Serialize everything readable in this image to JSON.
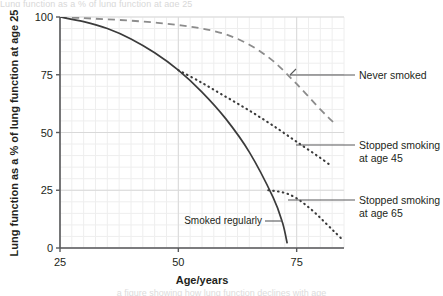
{
  "figure": {
    "background_color": "#ffffff",
    "plot": {
      "left_px": 60,
      "right_px": 344,
      "top_px": 17,
      "bottom_px": 248
    }
  },
  "axes": {
    "x": {
      "title": "Age/years",
      "ticks": [
        "25",
        "50",
        "75"
      ],
      "tick_values": [
        25,
        50,
        75
      ],
      "min": 25,
      "max": 85,
      "minor_step": 2.5
    },
    "y": {
      "title": "Lung function as a % of lung function at age 25",
      "ticks": [
        "100",
        "75",
        "50",
        "25",
        "0"
      ],
      "tick_values": [
        100,
        75,
        50,
        25,
        0
      ],
      "min": 0,
      "max": 100,
      "minor_step": 5
    }
  },
  "grid": {
    "major_color": "#d9d9d9",
    "minor_color": "#eeeeee",
    "axis_color": "#58595b",
    "enabled": true
  },
  "labels": {
    "never_smoked": "Never smoked",
    "stopped_45_line1": "Stopped smoking",
    "stopped_45_line2": "at age 45",
    "stopped_65_line1": "Stopped smoking",
    "stopped_65_line2": "at age 65",
    "smoked_regularly": "Smoked regularly"
  },
  "artifacts": {
    "top_text": "Lung function as a % of lung function at age 25",
    "bottom_text": "a figure showing how lung function declines with age"
  },
  "chart_data": {
    "type": "line",
    "title": "",
    "xlabel": "Age/years",
    "ylabel": "Lung function as a % of lung function at age 25",
    "xlim": [
      25,
      85
    ],
    "ylim": [
      0,
      100
    ],
    "grid": true,
    "legend_position": "right-annotations",
    "series": [
      {
        "name": "Never smoked",
        "style": "dashed",
        "color": "#8c8c8c",
        "x": [
          25,
          30,
          35,
          40,
          45,
          50,
          55,
          60,
          65,
          70,
          75,
          80,
          83
        ],
        "y": [
          100,
          99.5,
          99,
          98.4,
          97.6,
          96.5,
          95,
          92.5,
          88,
          81,
          71,
          60,
          54
        ]
      },
      {
        "name": "Smoked regularly",
        "style": "solid",
        "color": "#3b3b3b",
        "x": [
          25,
          30,
          35,
          40,
          45,
          50,
          55,
          60,
          65,
          70,
          72,
          73
        ],
        "y": [
          100,
          98,
          95,
          90.5,
          84.5,
          77,
          67.5,
          56,
          41.5,
          22,
          11,
          2
        ]
      },
      {
        "name": "Stopped smoking at age 45",
        "style": "dotted",
        "color": "#3b3b3b",
        "x": [
          50,
          55,
          60,
          65,
          70,
          75,
          80,
          82
        ],
        "y": [
          77,
          71.5,
          65.5,
          59.5,
          53,
          46,
          39,
          36
        ]
      },
      {
        "name": "Stopped smoking at age 65",
        "style": "dotted",
        "color": "#3b3b3b",
        "x": [
          69,
          71,
          73,
          75,
          77,
          79,
          81,
          83,
          84.5
        ],
        "y": [
          25,
          24.5,
          23.5,
          21.5,
          18.5,
          15,
          11,
          7,
          4
        ]
      }
    ],
    "annotations": [
      {
        "text": "Never smoked",
        "target_x": 75.5,
        "target_y": 77
      },
      {
        "text": "Stopped smoking at age 45",
        "target_x": 76.5,
        "target_y": 44
      },
      {
        "text": "Stopped smoking at age 65",
        "target_x": 72.5,
        "target_y": 19
      },
      {
        "text": "Smoked regularly",
        "target_x": 71.5,
        "target_y": 11
      }
    ]
  }
}
